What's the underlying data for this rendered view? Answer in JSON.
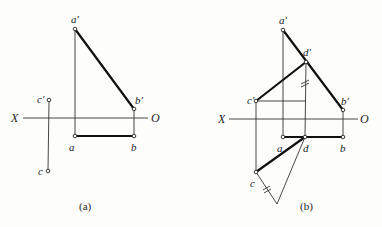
{
  "figure": {
    "panels": [
      {
        "id": "a",
        "caption": "(a)",
        "axis": {
          "left_label": "X",
          "right_label": "O"
        },
        "points": {
          "a_prime": {
            "label": "a′"
          },
          "b_prime": {
            "label": "b′"
          },
          "c_prime": {
            "label": "c′"
          },
          "a": {
            "label": "a"
          },
          "b": {
            "label": "b"
          },
          "c": {
            "label": "c"
          }
        }
      },
      {
        "id": "b",
        "caption": "(b)",
        "axis": {
          "left_label": "X",
          "right_label": "O"
        },
        "points": {
          "a_prime": {
            "label": "a′"
          },
          "d_prime": {
            "label": "d′"
          },
          "b_prime": {
            "label": "b′"
          },
          "c_prime": {
            "label": "c′"
          },
          "a": {
            "label": "a"
          },
          "d": {
            "label": "d"
          },
          "b": {
            "label": "b"
          },
          "c": {
            "label": "c"
          }
        }
      }
    ]
  }
}
